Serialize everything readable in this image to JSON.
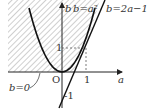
{
  "diagram": {
    "type": "coordinate-graph",
    "axes": {
      "x_label": "a",
      "y_label": "b",
      "origin_label": "O",
      "x_tick": "1",
      "y_tick": "1",
      "y_intercept": "-1"
    },
    "curves": [
      {
        "label": "b=a²",
        "equation": "b = a^2",
        "kind": "parabola"
      },
      {
        "label": "b=2a−1",
        "equation": "b = 2a - 1",
        "kind": "line"
      },
      {
        "label": "b=0",
        "equation": "b = 0",
        "kind": "line"
      }
    ],
    "shaded_region": "b > 0 to the left of b=2a−1 (for 1/2≤a≤1) and b=a² (for a≥1)",
    "colors": {
      "stroke": "#222222",
      "hatch": "#777777",
      "background": "#ffffff"
    }
  }
}
